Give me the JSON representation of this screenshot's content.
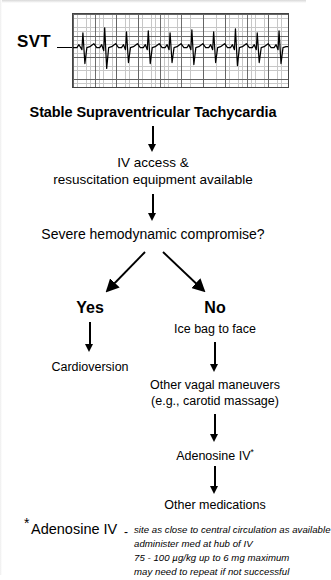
{
  "document": {
    "type": "clinical-algorithm-flowchart",
    "topic": "Stable Supraventricular Tachycardia"
  },
  "ecg": {
    "label": "SVT",
    "rhythm_description": "narrow-complex regular tachycardia strip",
    "grid": "standard ECG paper, fine minor squares with bold major squares every 5"
  },
  "flow": {
    "title": "Stable Supraventricular Tachycardia",
    "step_iv_line1": "IV access &",
    "step_iv_line2": "resuscitation equipment available",
    "decision": "Severe hemodynamic compromise?",
    "branch_yes_label": "Yes",
    "branch_no_label": "No",
    "yes_action": "Cardioversion",
    "no_step1": "Ice bag to face",
    "no_step2_line1": "Other vagal maneuvers",
    "no_step2_line2": "(e.g., carotid massage)",
    "no_step3": "Adenosine IV",
    "no_step3_marker": "*",
    "no_step4": "Other medications"
  },
  "footnote": {
    "marker": "*",
    "heading": "Adenosine IV",
    "dash": "-",
    "lines": [
      "site as close to central circulation as available",
      "administer med at hub of IV",
      "75 - 100 µg/kg up to 6 mg maximum",
      "may need to repeat if not successful"
    ]
  },
  "colors": {
    "ink": "#000000",
    "paper": "#ffffff",
    "grid_minor": "#9a9a9a",
    "grid_major": "#555555"
  }
}
